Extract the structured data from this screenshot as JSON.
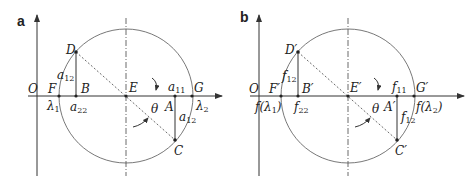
{
  "panels": [
    {
      "id": "a",
      "panel_label": "a",
      "origin_label": "O",
      "center_label": "E",
      "points": {
        "F": "F",
        "B": "B",
        "A": "A",
        "G": "G",
        "D": "D",
        "C": "C"
      },
      "values": {
        "lambda1": "λ",
        "lambda1_sub": "1",
        "lambda2": "λ",
        "lambda2_sub": "2",
        "a22": "a",
        "a22_sub": "22",
        "a11": "a",
        "a11_sub": "11",
        "a12_upper": "a",
        "a12_upper_sub": "12",
        "a12_lower": "a",
        "a12_lower_sub": "12"
      },
      "angle_label": "θ"
    },
    {
      "id": "b",
      "panel_label": "b",
      "origin_label": "O",
      "center_label": "E′",
      "points": {
        "F": "F′",
        "B": "B′",
        "A": "A′",
        "G": "G′",
        "D": "D′",
        "C": "C′"
      },
      "values": {
        "lambda1": "f(λ",
        "lambda1_sub": "1",
        "lambda1_close": ")",
        "lambda2": "f(λ",
        "lambda2_sub": "2",
        "lambda2_close": ")",
        "a22": "f",
        "a22_sub": "22",
        "a11": "f",
        "a11_sub": "11",
        "a12_upper": "f",
        "a12_upper_sub": "12",
        "a12_lower": "f",
        "a12_lower_sub": "12"
      },
      "angle_label": "θ"
    }
  ]
}
